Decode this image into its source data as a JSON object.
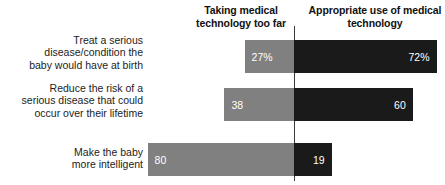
{
  "chart": {
    "type": "diverging_bar",
    "header_left": "Taking medical\ntechnology too far",
    "header_right": "Appropriate use of\nmedical technology"
  },
  "rows": [
    {
      "label": "Treat a serious\ndisease/condition the\nbaby would have at birth",
      "left_value_label": "27%",
      "right_value_label": "72%",
      "left_value": 27,
      "right_value": 72
    },
    {
      "label": "Reduce the risk of a\nserious disease that could\noccur over their lifetime",
      "left_value_label": "38",
      "right_value_label": "60",
      "left_value": 38,
      "right_value": 60
    },
    {
      "label": "Make the baby\nmore intelligent",
      "left_value_label": "80",
      "right_value_label": "19",
      "left_value": 80,
      "right_value": 19
    }
  ],
  "chart_data": {
    "type": "bar",
    "subtype": "diverging-horizontal",
    "title": "",
    "subtitle": "",
    "xlabel": "",
    "ylabel": "",
    "grid": false,
    "legend_position": "top",
    "categories": [
      "Treat a serious disease/condition the baby would have at birth",
      "Reduce the risk of a serious disease that could occur over their lifetime",
      "Make the baby more intelligent"
    ],
    "series": [
      {
        "name": "Taking medical technology too far",
        "direction": "left",
        "color": "#808080",
        "values": [
          27,
          38,
          80
        ],
        "data_labels": [
          "27%",
          "38",
          "80"
        ]
      },
      {
        "name": "Appropriate use of medical technology",
        "direction": "right",
        "color": "#1a1a1a",
        "values": [
          72,
          60,
          19
        ],
        "data_labels": [
          "72%",
          "60",
          "19"
        ]
      }
    ],
    "xlim": [
      0,
      100
    ],
    "units": "percent"
  },
  "colors": {
    "left_bar": "#808080",
    "right_bar": "#1a1a1a",
    "axis": "#3b3b3b",
    "background": "#ffffff",
    "text": "#1c1c1c",
    "value_text": "#ffffff"
  }
}
